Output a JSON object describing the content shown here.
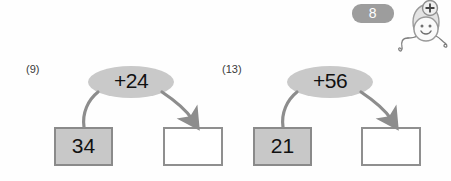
{
  "page": {
    "number_badge": "8",
    "badge_color": "#9d9d9d",
    "background": "#ffffff"
  },
  "mascot": {
    "name": "plus-mascot",
    "badge_symbol": "+",
    "expression": "smiling",
    "body_color": "#f2f2f2",
    "outline_color": "#9a9a9a"
  },
  "problems": [
    {
      "label": "(9)",
      "start_value": "34",
      "operation": "+24",
      "answer_value": "",
      "answer_placeholder": ""
    },
    {
      "label": "(13)",
      "start_value": "21",
      "operation": "+56",
      "answer_value": "",
      "answer_placeholder": ""
    }
  ],
  "colors": {
    "ellipse_fill": "#c9c9c9",
    "box_fill": "#c8c8c8",
    "box_border": "#8a8a8a",
    "answer_border": "#8f8f8f",
    "arrow": "#8d8d8d",
    "text": "#111111"
  }
}
